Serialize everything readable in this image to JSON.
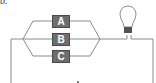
{
  "figure": {
    "label": "b.",
    "components": [
      {
        "id": "A",
        "label": "A"
      },
      {
        "id": "B",
        "label": "B"
      },
      {
        "id": "C",
        "label": "C"
      }
    ],
    "bulb": "light-bulb",
    "colors": {
      "wire": "#8a8a8a",
      "box": "#6e6e6e",
      "box_text": "#ffffff"
    }
  }
}
